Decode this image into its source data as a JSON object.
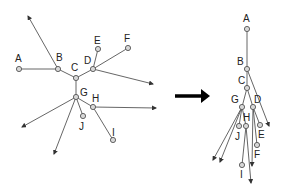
{
  "diagram": {
    "colors": {
      "edge": "#555555",
      "node_fill": "#d8d8d8",
      "arrow": "#000000",
      "text": "#222222"
    },
    "left_tree": {
      "nodes": [
        {
          "id": "A",
          "label": "A",
          "x": 19,
          "y": 69,
          "lx": 15,
          "ly": 62
        },
        {
          "id": "B",
          "label": "B",
          "x": 58,
          "y": 69,
          "lx": 56,
          "ly": 61
        },
        {
          "id": "C",
          "label": "C",
          "x": 76,
          "y": 78,
          "lx": 71,
          "ly": 71
        },
        {
          "id": "D",
          "label": "D",
          "x": 93,
          "y": 69,
          "lx": 84,
          "ly": 64
        },
        {
          "id": "E",
          "label": "E",
          "x": 98,
          "y": 49,
          "lx": 94,
          "ly": 44
        },
        {
          "id": "F",
          "label": "F",
          "x": 128,
          "y": 48,
          "lx": 124,
          "ly": 42
        },
        {
          "id": "G",
          "label": "G",
          "x": 76,
          "y": 97,
          "lx": 80,
          "ly": 96
        },
        {
          "id": "H",
          "label": "H",
          "x": 93,
          "y": 107,
          "lx": 92,
          "ly": 102
        },
        {
          "id": "J",
          "label": "J",
          "x": 83,
          "y": 116,
          "lx": 79,
          "ly": 130
        },
        {
          "id": "I",
          "label": "I",
          "x": 113,
          "y": 140,
          "lx": 112,
          "ly": 136
        }
      ],
      "edges": [
        [
          "A",
          "B"
        ],
        [
          "B",
          "C"
        ],
        [
          "C",
          "D"
        ],
        [
          "D",
          "E"
        ],
        [
          "D",
          "F"
        ],
        [
          "C",
          "G"
        ],
        [
          "G",
          "H"
        ],
        [
          "G",
          "J"
        ],
        [
          "H",
          "I"
        ]
      ],
      "outgoing_arrows": [
        {
          "from": "B",
          "to_x": 28,
          "to_y": 16
        },
        {
          "from": "D",
          "to_x": 153,
          "to_y": 84
        },
        {
          "from": "H",
          "to_x": 156,
          "to_y": 108
        },
        {
          "from": "G",
          "to_x": 22,
          "to_y": 127
        },
        {
          "from": "G",
          "to_x": 54,
          "to_y": 154
        }
      ]
    },
    "transform_arrow": {
      "x1": 175,
      "y1": 96,
      "x2": 210,
      "y2": 96
    },
    "right_tree": {
      "nodes": [
        {
          "id": "A",
          "label": "A",
          "x": 247,
          "y": 29,
          "lx": 243,
          "ly": 22
        },
        {
          "id": "B",
          "label": "B",
          "x": 247,
          "y": 69,
          "lx": 237,
          "ly": 65
        },
        {
          "id": "C",
          "label": "C",
          "x": 247,
          "y": 88,
          "lx": 238,
          "ly": 84
        },
        {
          "id": "G",
          "label": "G",
          "x": 242,
          "y": 107,
          "lx": 231,
          "ly": 103
        },
        {
          "id": "D",
          "label": "D",
          "x": 253,
          "y": 107,
          "lx": 254,
          "ly": 103
        },
        {
          "id": "H",
          "label": "H",
          "x": 246,
          "y": 126,
          "lx": 243,
          "ly": 121
        },
        {
          "id": "J",
          "label": "J",
          "x": 239,
          "y": 126,
          "lx": 235,
          "ly": 140
        },
        {
          "id": "E",
          "label": "E",
          "x": 260,
          "y": 125,
          "lx": 258,
          "ly": 138
        },
        {
          "id": "F",
          "label": "F",
          "x": 257,
          "y": 145,
          "lx": 254,
          "ly": 158
        },
        {
          "id": "I",
          "label": "I",
          "x": 242,
          "y": 165,
          "lx": 240,
          "ly": 178
        }
      ],
      "edges": [
        [
          "A",
          "B"
        ],
        [
          "B",
          "C"
        ],
        [
          "C",
          "G"
        ],
        [
          "C",
          "D"
        ],
        [
          "G",
          "H"
        ],
        [
          "G",
          "J"
        ],
        [
          "D",
          "E"
        ],
        [
          "D",
          "F"
        ],
        [
          "H",
          "I"
        ]
      ],
      "outgoing_arrows": [
        {
          "from": "B",
          "to_x": 269,
          "to_y": 126
        },
        {
          "from": "G",
          "to_x": 213,
          "to_y": 160
        },
        {
          "from": "G",
          "to_x": 220,
          "to_y": 162
        },
        {
          "from": "D",
          "to_x": 252,
          "to_y": 166
        },
        {
          "from": "H",
          "to_x": 251,
          "to_y": 183
        }
      ]
    }
  }
}
